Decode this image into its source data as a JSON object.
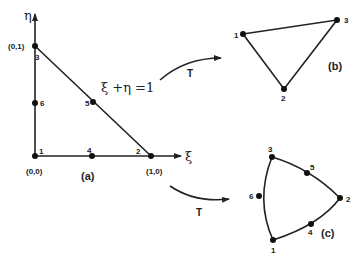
{
  "diagram": {
    "panel_a": {
      "caption": "(a)",
      "axis_x_label": "ξ",
      "axis_y_label": "η",
      "equation": "ξ +η =1",
      "coords": {
        "origin": "(0,0)",
        "x1": "(1,0)",
        "y1": "(0,1)"
      },
      "nodes": [
        {
          "id": "1",
          "x": 35,
          "y": 156
        },
        {
          "id": "2",
          "x": 151,
          "y": 156
        },
        {
          "id": "3",
          "x": 35,
          "y": 46
        },
        {
          "id": "4",
          "x": 92,
          "y": 156
        },
        {
          "id": "5",
          "x": 93,
          "y": 102
        },
        {
          "id": "6",
          "x": 35,
          "y": 103
        }
      ]
    },
    "panel_b": {
      "caption": "(b)",
      "nodes": [
        {
          "id": "1",
          "x": 243,
          "y": 34
        },
        {
          "id": "2",
          "x": 284,
          "y": 89
        },
        {
          "id": "3",
          "x": 337,
          "y": 20
        }
      ]
    },
    "panel_c": {
      "caption": "(c)",
      "nodes": [
        {
          "id": "1",
          "x": 273,
          "y": 240
        },
        {
          "id": "2",
          "x": 340,
          "y": 198
        },
        {
          "id": "3",
          "x": 272,
          "y": 157
        },
        {
          "id": "4",
          "x": 311,
          "y": 224
        },
        {
          "id": "5",
          "x": 307,
          "y": 173
        },
        {
          "id": "6",
          "x": 259,
          "y": 196
        }
      ]
    },
    "transform_upper": {
      "label": "T"
    },
    "transform_lower": {
      "label": "T"
    }
  }
}
